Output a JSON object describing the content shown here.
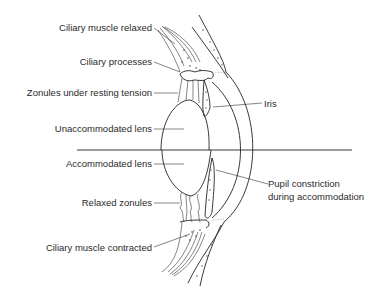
{
  "diagram": {
    "labels": {
      "ciliary_muscle_relaxed": "Ciliary muscle relaxed",
      "ciliary_processes": "Ciliary processes",
      "zonules_resting_tension": "Zonules under resting tension",
      "unaccommodated_lens": "Unaccommodated lens",
      "iris": "Iris",
      "accommodated_lens": "Accommodated lens",
      "relaxed_zonules": "Relaxed zonules",
      "pupil_constriction_line1": "Pupil constriction",
      "pupil_constriction_line2": "during accommodation",
      "ciliary_muscle_contracted": "Ciliary muscle contracted"
    },
    "colors": {
      "line": "#222222",
      "text": "#2a2a2a",
      "background": "#ffffff"
    }
  }
}
